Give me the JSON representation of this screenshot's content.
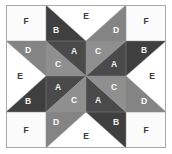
{
  "figure": {
    "name": "eight-pointed-star-quilt-block",
    "grid": {
      "columns": 4,
      "rows": 4,
      "unit_size_px": 36
    },
    "block": {
      "x": 6,
      "y": 5,
      "width": 160,
      "height": 143
    },
    "background": "#ffffff",
    "frame_color": "#a8a8a8",
    "seam_color": "#8c8c8c"
  },
  "fabrics": [
    {
      "key": "A",
      "label": "A",
      "color": "#4a4a4a",
      "tone": "dark",
      "label_class": "label-on-dark"
    },
    {
      "key": "B",
      "label": "B",
      "color": "#3f3f3f",
      "tone": "dark",
      "label_class": "label-on-dark"
    },
    {
      "key": "C",
      "label": "C",
      "color": "#8f8f8f",
      "tone": "mid",
      "label_class": "label-on-mid"
    },
    {
      "key": "D",
      "label": "D",
      "color": "#848484",
      "tone": "mid",
      "label_class": "label-on-mid"
    },
    {
      "key": "E",
      "label": "E",
      "color": "#ffffff",
      "tone": "light",
      "label_class": "label-on-light"
    },
    {
      "key": "F",
      "label": "F",
      "color": "#fbfbfb",
      "tone": "light",
      "label_class": "label-on-light"
    }
  ],
  "pieces": [
    {
      "id": "corner-tl-F",
      "fabric": "F",
      "label": "F",
      "points": "6,5 46,5 46,41 6,41",
      "lx": 26,
      "ly": 22
    },
    {
      "id": "corner-tr-F",
      "fabric": "F",
      "label": "F",
      "points": "126,5 166,5 166,41 126,41",
      "lx": 146,
      "ly": 22
    },
    {
      "id": "corner-bl-F",
      "fabric": "F",
      "label": "F",
      "points": "6,112 46,112 46,148 6,148",
      "lx": 26,
      "ly": 131
    },
    {
      "id": "corner-br-F",
      "fabric": "F",
      "label": "F",
      "points": "126,112 166,112 166,148 126,148",
      "lx": 146,
      "ly": 131
    },
    {
      "id": "top-B",
      "fabric": "B",
      "label": "B",
      "points": "46,5 86,41 46,41",
      "lx": 56,
      "ly": 31
    },
    {
      "id": "top-E",
      "fabric": "E",
      "label": "E",
      "points": "46,5 126,5 86,41",
      "lx": 86,
      "ly": 17
    },
    {
      "id": "top-D",
      "fabric": "D",
      "label": "D",
      "points": "126,5 126,41 86,41",
      "lx": 116,
      "ly": 31
    },
    {
      "id": "bottom-D",
      "fabric": "D",
      "label": "D",
      "points": "46,112 86,112 46,148",
      "lx": 56,
      "ly": 123
    },
    {
      "id": "bottom-E",
      "fabric": "E",
      "label": "E",
      "points": "46,148 86,112 126,148",
      "lx": 86,
      "ly": 137
    },
    {
      "id": "bottom-B",
      "fabric": "B",
      "label": "B",
      "points": "86,112 126,112 126,148",
      "lx": 116,
      "ly": 123
    },
    {
      "id": "left-D",
      "fabric": "D",
      "label": "D",
      "points": "6,41 46,41 46,76",
      "lx": 28,
      "ly": 51
    },
    {
      "id": "left-E",
      "fabric": "E",
      "label": "E",
      "points": "6,41 46,76 6,112",
      "lx": 20,
      "ly": 77
    },
    {
      "id": "left-B",
      "fabric": "B",
      "label": "B",
      "points": "6,112 46,76 46,112",
      "lx": 28,
      "ly": 102
    },
    {
      "id": "right-B",
      "fabric": "B",
      "label": "B",
      "points": "126,41 166,41 126,76",
      "lx": 144,
      "ly": 51
    },
    {
      "id": "right-E",
      "fabric": "E",
      "label": "E",
      "points": "166,41 166,112 126,76",
      "lx": 152,
      "ly": 77
    },
    {
      "id": "right-D",
      "fabric": "D",
      "label": "D",
      "points": "126,76 166,112 126,112",
      "lx": 144,
      "ly": 102
    },
    {
      "id": "center-tl-C",
      "fabric": "C",
      "label": "C",
      "points": "46,41 86,76 46,76",
      "lx": 58,
      "ly": 65
    },
    {
      "id": "center-tl-A",
      "fabric": "A",
      "label": "A",
      "points": "46,41 86,41 86,76",
      "lx": 74,
      "ly": 52
    },
    {
      "id": "center-tr-C",
      "fabric": "C",
      "label": "C",
      "points": "86,41 126,41 86,76",
      "lx": 98,
      "ly": 52
    },
    {
      "id": "center-tr-A",
      "fabric": "A",
      "label": "A",
      "points": "126,41 126,76 86,76",
      "lx": 114,
      "ly": 65
    },
    {
      "id": "center-bl-A",
      "fabric": "A",
      "label": "A",
      "points": "46,76 86,76 46,112",
      "lx": 58,
      "ly": 88
    },
    {
      "id": "center-bl-C",
      "fabric": "C",
      "label": "C",
      "points": "46,112 86,76 86,112",
      "lx": 74,
      "ly": 101
    },
    {
      "id": "center-br-A",
      "fabric": "A",
      "label": "A",
      "points": "86,76 126,112 86,112",
      "lx": 98,
      "ly": 101
    },
    {
      "id": "center-br-C",
      "fabric": "C",
      "label": "C",
      "points": "86,76 126,76 126,112",
      "lx": 114,
      "ly": 88
    }
  ],
  "seam_lines": [
    "M46,5 L46,148",
    "M126,5 L126,148",
    "M6,41 L166,41",
    "M6,112 L166,112",
    "M86,41 L86,112",
    "M46,76 L126,76",
    "M46,5 L86,41",
    "M126,5 L86,41",
    "M6,41 L46,76",
    "M166,41 L126,76",
    "M6,112 L46,76",
    "M166,112 L126,76",
    "M46,148 L86,112",
    "M126,148 L86,112",
    "M46,41 L86,76",
    "M126,41 L86,76",
    "M46,112 L86,76",
    "M126,112 L86,76"
  ]
}
